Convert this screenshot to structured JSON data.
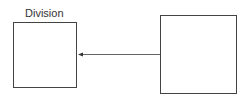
{
  "diagram": {
    "entities": [
      {
        "id": "left",
        "label": "Division"
      },
      {
        "id": "right",
        "label": ""
      }
    ],
    "relationship": {
      "from": "right",
      "to": "left",
      "type": "arrow"
    },
    "colors": {
      "stroke": "#444444",
      "line": "#666666",
      "text": "#333333"
    }
  }
}
